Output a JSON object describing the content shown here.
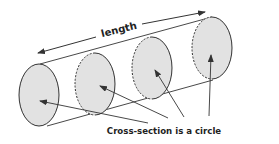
{
  "diagram": {
    "title_label": "length",
    "caption": "Cross-section is a circle",
    "colors": {
      "fill": "#e2e2e2",
      "stroke": "#333333",
      "text": "#222222"
    },
    "cross_sections": [
      {
        "id": 1,
        "style": "solid"
      },
      {
        "id": 2,
        "style": "dashed-left"
      },
      {
        "id": 3,
        "style": "dashed-left"
      },
      {
        "id": 4,
        "style": "dashed-left"
      }
    ]
  }
}
